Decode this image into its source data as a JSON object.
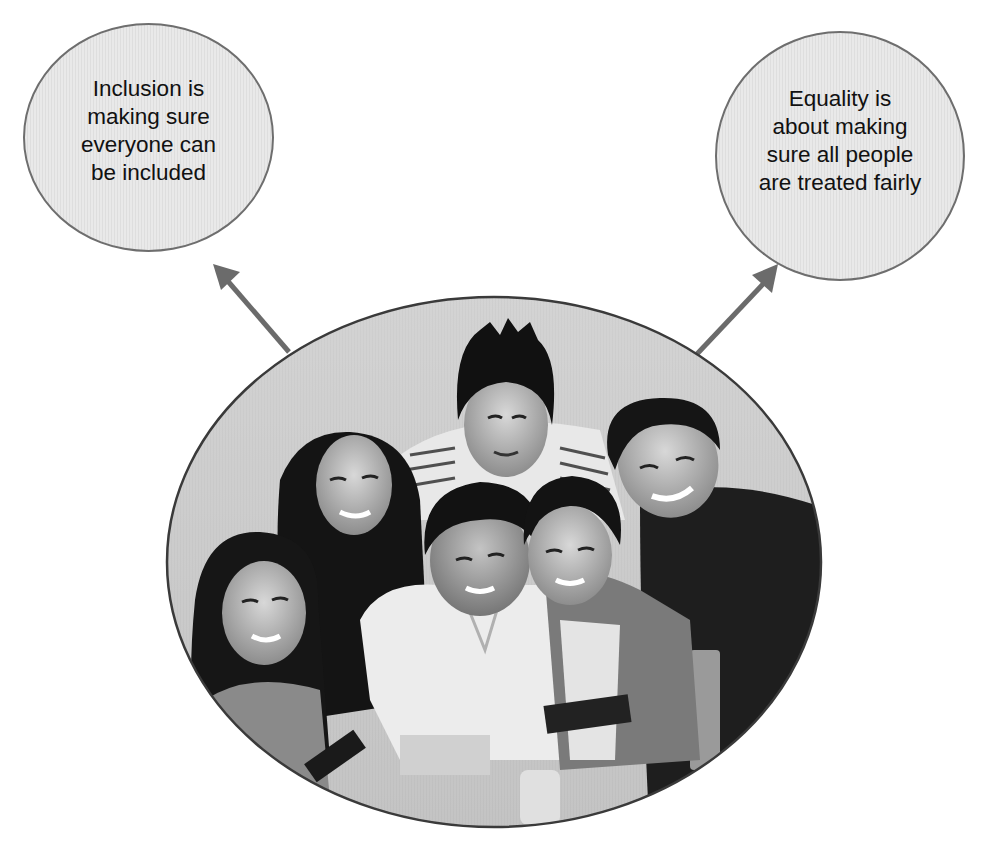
{
  "diagram": {
    "concepts": [
      {
        "id": "inclusion",
        "lines": [
          "Inclusion is",
          "making sure",
          "everyone can",
          "be included"
        ],
        "text": "Inclusion is making sure everyone can be included"
      },
      {
        "id": "equality",
        "lines": [
          "Equality is",
          "about making",
          "sure all people",
          "are treated fairly"
        ],
        "text": "Equality is about making sure all people are treated fairly"
      }
    ],
    "center_image": {
      "description": "Black-and-white photo of six smiling young people (students) huddled together, looking up at the camera",
      "people_count": 6,
      "shape": "ellipse"
    },
    "arrows": [
      {
        "from": "center_image",
        "to": "inclusion"
      },
      {
        "from": "center_image",
        "to": "equality"
      }
    ]
  },
  "colors": {
    "circle_fill": "#e6e6e6",
    "circle_outline": "#6e6e6e",
    "arrow": "#6b6b6b",
    "text": "#111111",
    "background": "#ffffff"
  }
}
